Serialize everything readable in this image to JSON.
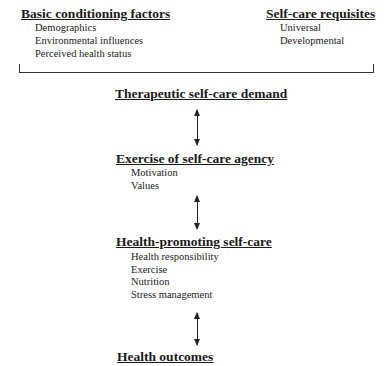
{
  "top_left": {
    "title": "Basic conditioning factors",
    "items": [
      "Demographics",
      "Environmental influences",
      "Perceived health status"
    ]
  },
  "top_right": {
    "title": "Self-care requisites",
    "items": [
      "Universal",
      "Developmental"
    ]
  },
  "therapeutic": {
    "title": "Therapeutic self-care demand"
  },
  "agency": {
    "title": "Exercise of self-care agency",
    "items": [
      "Motivation",
      "Values"
    ]
  },
  "promoting": {
    "title": "Health-promoting self-care",
    "items": [
      "Health responsibility",
      "Exercise",
      "Nutrition",
      "Stress management"
    ]
  },
  "outcomes": {
    "title": "Health outcomes"
  },
  "connectors": [
    "double-arrow",
    "double-arrow",
    "double-arrow"
  ]
}
